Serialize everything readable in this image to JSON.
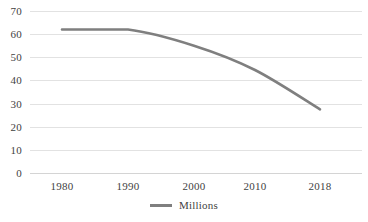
{
  "chart_data": {
    "type": "line",
    "title": "",
    "subtitle": "",
    "xlabel": "",
    "ylabel": "",
    "x": [
      "1980",
      "1990",
      "2000",
      "2010",
      "2018"
    ],
    "categories": [
      "1980",
      "1990",
      "2000",
      "2010",
      "2018"
    ],
    "series": [
      {
        "name": "Millions",
        "color": "#7f7f7f",
        "values": [
          62,
          62,
          55,
          44.5,
          27.5
        ]
      }
    ],
    "values": [
      62,
      62,
      55,
      44.5,
      27.5
    ],
    "ylim": [
      0,
      70
    ],
    "y_ticks": [
      "0",
      "10",
      "20",
      "30",
      "40",
      "50",
      "60",
      "70"
    ],
    "x_ticks": [
      "1980",
      "1990",
      "2000",
      "2010",
      "2018"
    ],
    "grid": "horizontal",
    "legend": {
      "position": "bottom",
      "entries": [
        {
          "label": "Millions",
          "color": "#7f7f7f"
        }
      ]
    },
    "colors": {
      "series_line": "#7f7f7f",
      "gridline": "#e2e2e2",
      "axis": "#d4d4d4",
      "text": "#3f3f3f",
      "background": "#ffffff"
    }
  }
}
